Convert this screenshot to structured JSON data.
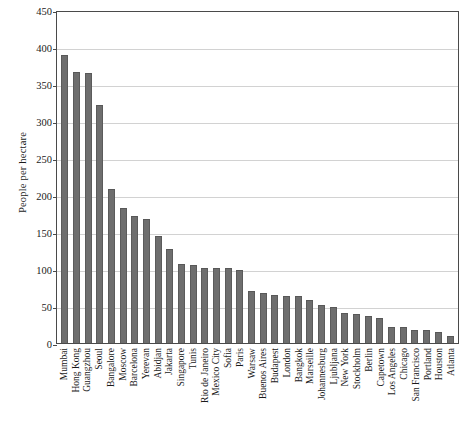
{
  "chart_data": {
    "type": "bar",
    "title": "",
    "xlabel": "",
    "ylabel": "People per hectare",
    "ylim": [
      0,
      450
    ],
    "ytick_step": 50,
    "yticks": [
      0,
      50,
      100,
      150,
      200,
      250,
      300,
      350,
      400,
      450
    ],
    "grid": "horizontal",
    "legend": "none",
    "bar_color": "#6e6e6e",
    "categories": [
      "Mumbai",
      "Hong Kong",
      "Guangzhou",
      "Seoul",
      "Bangalore",
      "Moscow",
      "Barcelona",
      "Yerevan",
      "Abidjan",
      "Jakarta",
      "Singapore",
      "Tunis",
      "Rio de Janeiro",
      "Mexico City",
      "Sofia",
      "Paris",
      "Warsaw",
      "Buenos Aires",
      "Budapest",
      "London",
      "Bangkok",
      "Marseille",
      "Johannesburg",
      "Ljubljana",
      "New York",
      "Stockholm",
      "Berlin",
      "Capetown",
      "Los Angeles",
      "Chicago",
      "San Francisco",
      "Portland",
      "Houston",
      "Atlanta"
    ],
    "values": [
      389,
      366,
      365,
      322,
      208,
      183,
      171,
      168,
      145,
      127,
      107,
      105,
      102,
      101,
      101,
      98,
      70,
      68,
      65,
      64,
      63,
      58,
      51,
      48,
      41,
      39,
      37,
      34,
      22,
      21,
      18,
      17,
      15,
      9
    ]
  }
}
